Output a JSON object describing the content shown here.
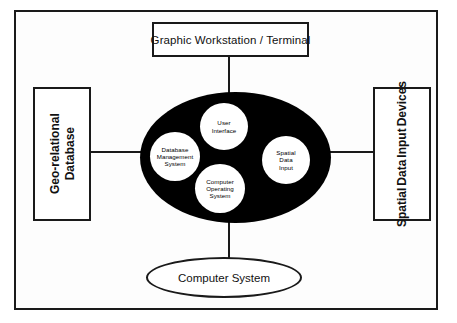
{
  "diagram": {
    "frame": {
      "name": "outer-frame"
    },
    "nodes": {
      "workstation": {
        "label": "Graphic Workstation / Terminal"
      },
      "geo_relational_database": {
        "lines": [
          "Geo-relational",
          "Database"
        ]
      },
      "spatial_data_input_devices": {
        "lines": [
          "Spatial",
          "Data",
          "Input",
          "Devices"
        ]
      },
      "computer_system": {
        "label": "Computer System"
      },
      "core_ellipse": {
        "label": "Computer System core"
      }
    },
    "core_components": [
      {
        "id": "user-interface",
        "lines": [
          "User",
          "Interface"
        ]
      },
      {
        "id": "database-management-system",
        "lines": [
          "Database",
          "Management",
          "System"
        ]
      },
      {
        "id": "spatial-data-input",
        "lines": [
          "Spatial",
          "Data",
          "Input"
        ]
      },
      {
        "id": "computer-operating-system",
        "lines": [
          "Computer",
          "Operating",
          "System"
        ]
      }
    ],
    "connectors": [
      {
        "id": "workstation-to-core",
        "orientation": "vertical"
      },
      {
        "id": "geodb-to-core",
        "orientation": "horizontal"
      },
      {
        "id": "core-to-devices",
        "orientation": "horizontal"
      },
      {
        "id": "core-to-computer-system",
        "orientation": "vertical"
      }
    ],
    "colors": {
      "stroke": "#1a1a1a",
      "core_fill": "#000000",
      "node_fill": "#ffffff",
      "page_background": "#ffffff"
    }
  }
}
